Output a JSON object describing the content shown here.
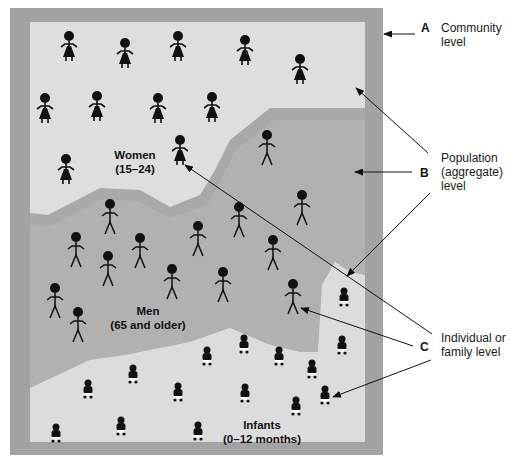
{
  "colors": {
    "frame": "#a3a3a3",
    "community_fill": "#dedede",
    "men_band": "#a9a9a9",
    "men_fill": "#b1b1b1",
    "infant_fill": "#dcdcdc",
    "ink": "#111111",
    "background": "#ffffff"
  },
  "annotations": [
    {
      "letter": "A",
      "lines": [
        "Community",
        "level"
      ]
    },
    {
      "letter": "B",
      "lines": [
        "Population",
        "(aggregate)",
        "level"
      ]
    },
    {
      "letter": "C",
      "lines": [
        "Individual or",
        "family level"
      ]
    }
  ],
  "regions": {
    "women": {
      "name": "Women",
      "range": "(15–24)"
    },
    "men": {
      "name": "Men",
      "range": "(65 and older)"
    },
    "infants": {
      "name": "Infants",
      "range": "(0–12 months)"
    }
  },
  "figures": {
    "women": [
      [
        69,
        44
      ],
      [
        125,
        51
      ],
      [
        178,
        44
      ],
      [
        245,
        48
      ],
      [
        300,
        67
      ],
      [
        45,
        106
      ],
      [
        97,
        104
      ],
      [
        158,
        106
      ],
      [
        212,
        105
      ],
      [
        66,
        167
      ],
      [
        180,
        148
      ]
    ],
    "men": [
      [
        267,
        143
      ],
      [
        110,
        212
      ],
      [
        302,
        203
      ],
      [
        239,
        215
      ],
      [
        76,
        245
      ],
      [
        140,
        246
      ],
      [
        198,
        234
      ],
      [
        273,
        248
      ],
      [
        108,
        264
      ],
      [
        172,
        277
      ],
      [
        223,
        280
      ],
      [
        55,
        296
      ],
      [
        78,
        320
      ],
      [
        293,
        292
      ]
    ],
    "infants": [
      [
        344,
        296
      ],
      [
        244,
        343
      ],
      [
        207,
        355
      ],
      [
        279,
        355
      ],
      [
        342,
        344
      ],
      [
        133,
        373
      ],
      [
        312,
        368
      ],
      [
        88,
        388
      ],
      [
        178,
        391
      ],
      [
        245,
        392
      ],
      [
        325,
        394
      ],
      [
        296,
        405
      ],
      [
        121,
        425
      ],
      [
        56,
        432
      ],
      [
        198,
        430
      ]
    ]
  }
}
